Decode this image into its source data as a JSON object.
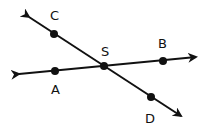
{
  "diagram": {
    "type": "intersecting-lines",
    "lines": [
      {
        "name": "line-AB",
        "through": [
          "A",
          "S",
          "B"
        ]
      },
      {
        "name": "line-CD",
        "through": [
          "C",
          "S",
          "D"
        ]
      }
    ],
    "points": [
      {
        "id": "C",
        "label": "C"
      },
      {
        "id": "S",
        "label": "S"
      },
      {
        "id": "B",
        "label": "B"
      },
      {
        "id": "A",
        "label": "A"
      },
      {
        "id": "D",
        "label": "D"
      }
    ],
    "color": "#111111"
  }
}
